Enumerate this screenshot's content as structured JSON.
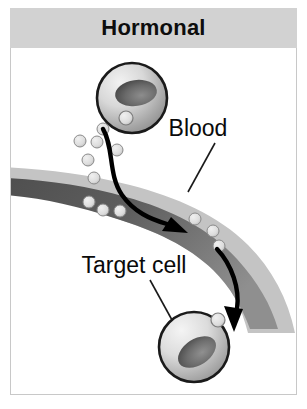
{
  "header": {
    "title": "Hormonal",
    "background_color": "#d2d2d2",
    "text_color": "#0d0d0d"
  },
  "panel": {
    "background_color": "#ffffff",
    "border_color": "#c8c8c8"
  },
  "labels": {
    "blood": "Blood",
    "target_cell": "Target cell"
  },
  "colors": {
    "cell_outline": "#1a1a1a",
    "cell_fill_light": "#e8e8e8",
    "cell_fill_mid": "#9a9a9a",
    "nucleus_dark": "#4a4a4a",
    "vessel_wall": "#c4c4c4",
    "vessel_lumen_dark": "#5e5e5e",
    "vessel_lumen_light": "#8f8f8f",
    "particle_fill": "#dcdcdc",
    "particle_outline": "#8a8a8a",
    "arrow": "#000000",
    "leader_line": "#1a1a1a"
  },
  "diagram": {
    "type": "biology-illustration",
    "topic": "Hormonal signaling",
    "secreting_cell": {
      "name": "secreting-cell",
      "cx": 132,
      "cy": 99,
      "r": 36,
      "receptor": {
        "cx": 122,
        "cy": 119,
        "r": 7
      }
    },
    "target_cell": {
      "name": "target-cell",
      "cx": 194,
      "cy": 348,
      "r": 36,
      "receptor": {
        "cx": 218,
        "cy": 320,
        "r": 7
      }
    },
    "hormone_particles_outside": [
      {
        "cx": 98,
        "cy": 127,
        "r": 6
      },
      {
        "cx": 75,
        "cy": 138,
        "r": 6
      },
      {
        "cx": 91,
        "cy": 140,
        "r": 6
      },
      {
        "cx": 112,
        "cy": 148,
        "r": 6
      },
      {
        "cx": 82,
        "cy": 158,
        "r": 6
      },
      {
        "cx": 89,
        "cy": 176,
        "r": 6
      }
    ],
    "hormone_particles_in_vessel": [
      {
        "cx": 89,
        "cy": 200,
        "r": 6
      },
      {
        "cx": 101,
        "cy": 208,
        "r": 6
      },
      {
        "cx": 118,
        "cy": 208,
        "r": 6
      },
      {
        "cx": 193,
        "cy": 217,
        "r": 6
      },
      {
        "cx": 211,
        "cy": 226,
        "r": 6
      },
      {
        "cx": 217,
        "cy": 239,
        "r": 6
      }
    ],
    "arrows": [
      {
        "name": "secretion-arrow",
        "from": "secreting cell",
        "to": "blood vessel"
      },
      {
        "name": "delivery-arrow",
        "from": "blood vessel",
        "to": "target cell"
      }
    ],
    "leader_lines": [
      {
        "name": "blood-leader",
        "label": "Blood"
      },
      {
        "name": "target-cell-leader",
        "label": "Target cell"
      }
    ]
  }
}
